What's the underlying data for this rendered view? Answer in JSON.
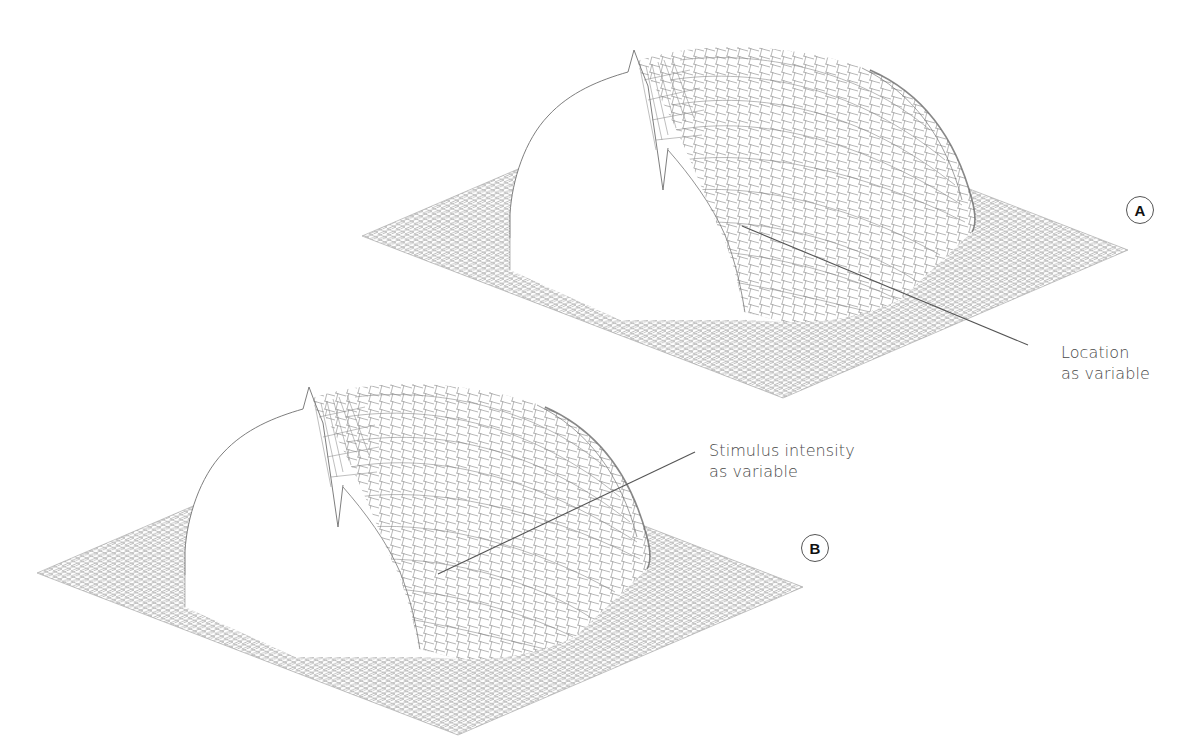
{
  "figure": {
    "panels": [
      {
        "id": "A",
        "badge": "A",
        "annotation_line1": "Location",
        "annotation_line2": "as variable",
        "offset": [
          0,
          0
        ]
      },
      {
        "id": "B",
        "badge": "B",
        "annotation_line1": "Stimulus intensity",
        "annotation_line2": "as variable",
        "offset": [
          -325,
          337
        ]
      }
    ],
    "surface": {
      "description": "3D wireframe surface: flat grid plane with a dome-shaped hill, sharp spike at the back-left cross-section edge",
      "mesh_color": "#8a8a8a",
      "profile_color": "#707070",
      "leader_color": "#555555"
    }
  }
}
